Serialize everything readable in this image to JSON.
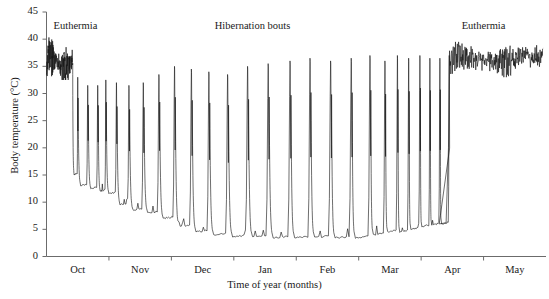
{
  "chart_data": {
    "type": "line",
    "title": "",
    "xlabel": "Time of year (months)",
    "ylabel": "Body temperature (°C)",
    "ylim": [
      0,
      45
    ],
    "yticks": [
      0,
      5,
      10,
      15,
      20,
      25,
      30,
      35,
      40,
      45
    ],
    "xlim": [
      0,
      8
    ],
    "categories": [
      "Oct",
      "Nov",
      "Dec",
      "Jan",
      "Feb",
      "Mar",
      "Apr",
      "May"
    ],
    "xtick_labels": [
      "Oct",
      "Nov",
      "Dec",
      "Jan",
      "Feb",
      "Mar",
      "Apr",
      "May"
    ],
    "grid": false,
    "legend": "none",
    "line_color": "#141414",
    "axis_color": "#6b6b6b",
    "annotations": [
      {
        "text": "Euthermia",
        "x_month": 0.05,
        "y_value": 42.5,
        "align": "left"
      },
      {
        "text": "Hibernation bouts",
        "x_month": 3.3,
        "y_value": 42.5,
        "align": "center"
      },
      {
        "text": "Euthermia",
        "x_month": 7.0,
        "y_value": 42.5,
        "align": "center"
      }
    ],
    "series": [
      {
        "name": "Body temperature",
        "description": "Ground squirrel core body temperature across one hibernation season: an initial euthermic period of high variable temperature, a sequence of deep torpor bouts punctuated by periodic arousal spikes to euthermic levels, and a final euthermic period in spring.",
        "phases": [
          {
            "phase": "initial-euthermia",
            "x_start_month": 0.0,
            "x_end_month": 0.42,
            "temp_min": 32.5,
            "temp_max": 40.5,
            "temp_mean": 36.0,
            "pattern": "dense-oscillation"
          },
          {
            "phase": "early-torpor-bouts",
            "x_start_month": 0.42,
            "x_end_month": 1.55,
            "trough_start": 15.0,
            "trough_end": 8.5,
            "peak_temp": 33.0,
            "bout_count": 7,
            "pattern": "shallow-torpor-with-arousal-spikes"
          },
          {
            "phase": "deepening-torpor",
            "x_start_month": 1.55,
            "x_end_month": 2.9,
            "trough_start": 8.0,
            "trough_end": 4.0,
            "peak_temp": 35.0,
            "bout_count": 5,
            "pattern": "lengthening-bouts"
          },
          {
            "phase": "deep-winter-torpor",
            "x_start_month": 2.9,
            "x_end_month": 5.0,
            "trough_start": 3.6,
            "trough_end": 3.4,
            "peak_temp": 36.5,
            "bout_count": 7,
            "pattern": "long-regular-bouts"
          },
          {
            "phase": "spring-arousals",
            "x_start_month": 5.0,
            "x_end_month": 6.45,
            "trough_start": 4.0,
            "trough_end": 6.0,
            "peak_temp": 37.0,
            "bout_count": 7,
            "pattern": "shortening-bouts-rising-baseline"
          },
          {
            "phase": "final-euthermia",
            "x_start_month": 6.45,
            "x_end_month": 7.95,
            "temp_min": 33.0,
            "temp_max": 39.5,
            "temp_mean": 36.3,
            "pattern": "dense-oscillation"
          }
        ],
        "arousal_peaks_x_month": [
          0.5,
          0.66,
          0.82,
          0.95,
          1.12,
          1.32,
          1.55,
          1.8,
          2.05,
          2.32,
          2.6,
          2.9,
          3.22,
          3.55,
          3.9,
          4.22,
          4.55,
          4.88,
          5.18,
          5.42,
          5.62,
          5.8,
          5.98,
          6.14,
          6.3,
          6.45
        ],
        "arousal_peak_values": [
          33.0,
          31.5,
          31.5,
          32.5,
          32.0,
          31.5,
          32.0,
          33.5,
          35.0,
          34.5,
          34.0,
          33.5,
          35.0,
          35.5,
          36.0,
          36.5,
          36.0,
          36.5,
          37.0,
          36.0,
          37.0,
          36.5,
          37.0,
          36.5,
          36.5,
          37.0
        ],
        "torpor_minima_values": [
          15.0,
          13.0,
          12.5,
          12.0,
          11.5,
          9.5,
          8.5,
          8.0,
          7.0,
          5.5,
          4.5,
          4.0,
          3.6,
          3.5,
          3.4,
          3.4,
          3.5,
          3.4,
          3.4,
          4.0,
          4.5,
          4.5,
          5.0,
          5.5,
          5.8,
          6.0
        ]
      }
    ]
  },
  "axes": {
    "y_ticks": [
      "0",
      "5",
      "10",
      "15",
      "20",
      "25",
      "30",
      "35",
      "40",
      "45"
    ],
    "x_ticks": [
      "Oct",
      "Nov",
      "Dec",
      "Jan",
      "Feb",
      "Mar",
      "Apr",
      "May"
    ],
    "x_axis_title": "Time of year (months)",
    "y_axis_title": "Body temperature (°C)"
  },
  "annotations": {
    "left_euthermia": "Euthermia",
    "hibernation_bouts": "Hibernation bouts",
    "right_euthermia": "Euthermia"
  }
}
